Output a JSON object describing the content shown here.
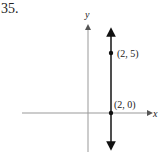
{
  "problem": {
    "number": "35."
  },
  "axes": {
    "x_label": "x",
    "y_label": "y",
    "origin_px": [
      88,
      113
    ],
    "unit_px": 11.6
  },
  "line": {
    "equation": "x = 2",
    "orientation": "vertical",
    "color": "#222222"
  },
  "points": [
    {
      "label": "(2, 5)",
      "x": 2,
      "y": 5
    },
    {
      "label": "(2, 0)",
      "x": 2,
      "y": 0
    }
  ],
  "colors": {
    "axis": "#999999",
    "line": "#222222",
    "text": "#222222"
  }
}
